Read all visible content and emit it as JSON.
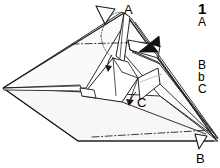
{
  "page": {
    "background_color": "#ffffff",
    "ink_color": "#1a1a1a",
    "panel_fill_light": "#fbfbfb",
    "panel_fill_shade": "#f2f2f2",
    "panel_fill_white": "#ffffff"
  },
  "instructions": {
    "step_number": "1",
    "lines": [
      {
        "id": "line-1",
        "text": "A"
      },
      {
        "id": "line-2",
        "text": "B"
      },
      {
        "id": "line-3",
        "text": "b"
      },
      {
        "id": "line-4",
        "text": "C"
      }
    ]
  },
  "diagram": {
    "type": "origami-fold-step",
    "vertex_labels": [
      {
        "id": "vertex-a",
        "text": "A",
        "x": 124,
        "y": 3
      },
      {
        "id": "vertex-c",
        "text": "C",
        "x": 137,
        "y": 96
      },
      {
        "id": "vertex-b",
        "text": "B",
        "x": 196,
        "y": 152
      }
    ],
    "arrows": [
      {
        "id": "hollow-arrow-top",
        "style": "hollow",
        "semantic": "fold-direction-arrow",
        "description": "open outline arrowhead pointing down-right toward apex A",
        "x": 104,
        "y": 9
      },
      {
        "id": "solid-arrow-right",
        "style": "solid",
        "semantic": "push-fold-arrow",
        "description": "filled black arrowhead pointing left-down into the upper right flap",
        "x": 146,
        "y": 48
      },
      {
        "id": "curved-arrow-center",
        "style": "thin-curved",
        "semantic": "small-fold-arrow",
        "description": "small curved arrow pointing down near model center",
        "x": 108,
        "y": 64
      },
      {
        "id": "curved-arrow-c",
        "style": "thin-curved",
        "semantic": "small-fold-arrow-c",
        "description": "small curved arrow pointing down-left next to label C",
        "x": 130,
        "y": 100
      },
      {
        "id": "hollow-arrow-bottom",
        "style": "hollow",
        "semantic": "fold-direction-arrow",
        "description": "open outline arrowhead pointing down-right near label B",
        "x": 198,
        "y": 138
      }
    ],
    "fold_lines": [
      {
        "id": "fold-line-upper",
        "style": "dash-dot",
        "description": "horizontal dash-dot crease across the upper body"
      },
      {
        "id": "fold-line-lower",
        "style": "dash-dot",
        "description": "dash-dot crease along the lower right base"
      },
      {
        "id": "hidden-arc",
        "style": "dotted",
        "description": "dotted curved arc showing hidden edge near apex A"
      }
    ]
  }
}
